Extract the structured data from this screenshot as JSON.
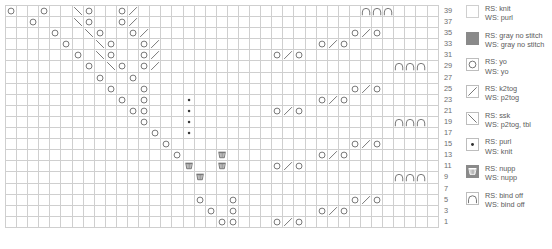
{
  "chart_title": "Lace Knitting Chart",
  "grid": {
    "columns": 39,
    "rows": 20,
    "cell_px": 11.1,
    "colors": {
      "no_stitch_gray": "#8a8a8a",
      "grid_line": "#cfcfcf",
      "symbol_stroke": "#6d6d6d",
      "background": "#ffffff"
    }
  },
  "row_numbers": [
    "39",
    "37",
    "35",
    "33",
    "31",
    "29",
    "27",
    "25",
    "23",
    "21",
    "19",
    "17",
    "15",
    "13",
    "11",
    "9",
    "7",
    "5",
    "3",
    "1"
  ],
  "legend": {
    "items": [
      {
        "key": "blank",
        "symbol": "knit-symbol",
        "rs": "RS: knit",
        "ws": "WS: purl"
      },
      {
        "key": "gray",
        "symbol": "no-stitch-symbol",
        "rs": "RS: gray no stitch",
        "ws": "WS: gray no stitch"
      },
      {
        "key": "yo",
        "symbol": "yarn-over-symbol",
        "rs": "RS: yo",
        "ws": "WS: yo"
      },
      {
        "key": "k2tog",
        "symbol": "k2tog-symbol",
        "rs": "RS: k2tog",
        "ws": "WS: p2tog"
      },
      {
        "key": "ssk",
        "symbol": "ssk-symbol",
        "rs": "RS: ssk",
        "ws": "WS: p2tog, tbl"
      },
      {
        "key": "purl",
        "symbol": "purl-symbol",
        "rs": "RS: purl",
        "ws": "WS: knit"
      },
      {
        "key": "nupp",
        "symbol": "nupp-symbol",
        "rs": "RS: nupp",
        "ws": "WS: nupp"
      },
      {
        "key": "bindoff",
        "symbol": "bind-off-symbol",
        "rs": "RS: bind off",
        "ws": "WS: bind off"
      }
    ]
  },
  "chart_data": {
    "type": "table",
    "symbol_key": {
      "k": "knit (blank)",
      "g": "gray no stitch",
      "o": "yo",
      "/": "k2tog",
      "\\": "ssk",
      ".": "purl",
      "n": "nupp",
      "b": "bind off"
    },
    "rows": [
      {
        "n": "39",
        "cells": "ok kok k\\ok ko/k kkkk kkkk kkkk kkkk kkkb bb"
      },
      {
        "n": "37",
        "cells": "ggok kk\\o kko/ kkkk kkkk kkkk kkkk kkkk kkkk kk"
      },
      {
        "n": "35",
        "cells": "gggg okk\\ okko /kkk kkkk kkkk kkkk kkko /okk kk"
      },
      {
        "n": "33",
        "cells": "gggg gokk \\okk o/kk kkkk kkkk kkkk o/ok kkgg kk"
      },
      {
        "n": "31",
        "cells": "gggg ggok \\okk o/kk kkkk kkkk o/ok kkkg gkkk kk"
      },
      {
        "n": "29",
        "cells": "gggg gggo k\\ok o/kk kkkk kkkk kkkk kkkk kkkb bb"
      },
      {
        "n": "27",
        "cells": "gggg gggg okko kkkk kkkk kkkk kkkk kkkk kkkk kk"
      },
      {
        "n": "25",
        "cells": "gggg gggg gokk okkk kkkk kkkk kkkk kkko /okk kk"
      },
      {
        "n": "23",
        "cells": "gggg gggg ggok okkk .kkk kkkk kkkk o/ok kkgg kk"
      },
      {
        "n": "21",
        "cells": "gggg gggg gggo okkk .kkk kkkk o/ok kkkg gkkk kk"
      },
      {
        "n": "19",
        "cells": "gggg gggg gggg okkk .kkk kkkk kkkk kkkk kkkb bb"
      },
      {
        "n": "17",
        "cells": "gggg gggg gggg gokk .kkk kkkk kkkk kkkk kkkk kk"
      },
      {
        "n": "15",
        "cells": "gggg gggg gggg ggok kkkk kkkk kkkk kkko /okk kk"
      },
      {
        "n": "13",
        "cells": "gggg gggg gggg gggo kkkn kkkk kkkk o/ok kkgg kk"
      },
      {
        "n": "11",
        "cells": "gggg gggg gggg gggg nkkn kkkk o/ok kkkg gkkk kk"
      },
      {
        "n": "9",
        "cells": "gggg gggg gggg gggg knkk kkkk kkkk kkkk kkkb bb"
      },
      {
        "n": "7",
        "cells": "gggg gggg gggg gggg kkkk kkkk kkkk kkkk kkkk kk"
      },
      {
        "n": "5",
        "cells": "gggg gggg gggg gggg gokk okkk kkkk kkko /okk kk"
      },
      {
        "n": "3",
        "cells": "gggg gggg gggg gggg ggok okkk kkkk o/ok kkgg kk"
      },
      {
        "n": "1",
        "cells": "gggg gggg gggg gggg gggo okkk o/ok kkkg gkkk kk"
      }
    ]
  }
}
